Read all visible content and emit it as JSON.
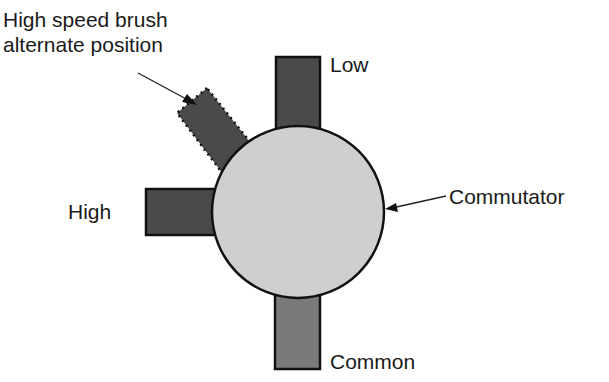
{
  "diagram": {
    "type": "motor-brush-diagram",
    "labels": {
      "alternate": [
        "High speed brush",
        "alternate position"
      ],
      "low": "Low",
      "high": "High",
      "common": "Common",
      "commutator": "Commutator"
    },
    "colors": {
      "brush_dark": "#4a4a4a",
      "brush_common": "#7a7a7a",
      "commutator_fill": "#cfcfcf",
      "outline": "#111111",
      "text": "#1a1a1a"
    }
  }
}
